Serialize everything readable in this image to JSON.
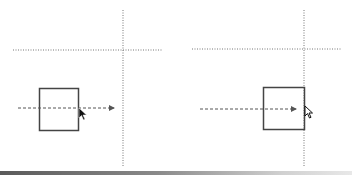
{
  "diagram": {
    "colors": {
      "line": "#555555",
      "box": "#444444",
      "guide": "#777777",
      "cursor": "#111111"
    },
    "panels": [
      {
        "name": "before",
        "guide_vertical": {
          "x": 123,
          "y1": 10,
          "y2": 166
        },
        "guide_horizontal": {
          "y": 50,
          "x1": 13,
          "x2": 162
        },
        "box": {
          "x": 39,
          "y": 88,
          "w": 39,
          "h": 42
        },
        "arrow": {
          "x1": 18,
          "x2": 114,
          "y": 108
        },
        "cursor": {
          "x": 79,
          "y": 108
        }
      },
      {
        "name": "after",
        "guide_vertical": {
          "x": 304,
          "y1": 10,
          "y2": 166
        },
        "guide_horizontal": {
          "y": 49,
          "x1": 192,
          "x2": 342
        },
        "box": {
          "x": 263,
          "y": 87,
          "w": 41,
          "h": 42
        },
        "arrow": {
          "x1": 200,
          "x2": 296,
          "y": 109
        },
        "cursor": {
          "x": 305,
          "y": 107
        }
      }
    ]
  }
}
